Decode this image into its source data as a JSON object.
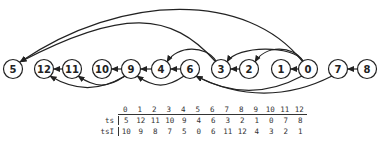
{
  "graph": {
    "nodes": [
      "5",
      "12",
      "11",
      "10",
      "9",
      "4",
      "6",
      "3",
      "2",
      "1",
      "0",
      "7",
      "8"
    ],
    "edges": [
      {
        "from": "11",
        "to": "12",
        "style": "straight"
      },
      {
        "from": "9",
        "to": "10",
        "style": "straight"
      },
      {
        "from": "4",
        "to": "9",
        "style": "straight"
      },
      {
        "from": "6",
        "to": "4",
        "style": "straight"
      },
      {
        "from": "2",
        "to": "3",
        "style": "straight"
      },
      {
        "from": "0",
        "to": "1",
        "style": "straight"
      },
      {
        "from": "8",
        "to": "7",
        "style": "straight"
      },
      {
        "from": "9",
        "to": "12",
        "style": "below"
      },
      {
        "from": "9",
        "to": "11",
        "style": "below"
      },
      {
        "from": "6",
        "to": "9",
        "style": "below"
      },
      {
        "from": "3",
        "to": "4",
        "style": "above"
      },
      {
        "from": "0",
        "to": "3",
        "style": "above"
      },
      {
        "from": "0",
        "to": "2",
        "style": "above"
      },
      {
        "from": "0",
        "to": "5",
        "style": "arc-high"
      },
      {
        "from": "3",
        "to": "5",
        "style": "arc-low"
      },
      {
        "from": "0",
        "to": "6",
        "style": "below"
      },
      {
        "from": "7",
        "to": "6",
        "style": "below"
      }
    ]
  },
  "table": {
    "header": [
      "0",
      "1",
      "2",
      "3",
      "4",
      "5",
      "6",
      "7",
      "8",
      "9",
      "10",
      "11",
      "12"
    ],
    "rows": [
      {
        "label": "ts",
        "values": [
          "5",
          "12",
          "11",
          "10",
          "9",
          "4",
          "6",
          "3",
          "2",
          "1",
          "0",
          "7",
          "8"
        ]
      },
      {
        "label": "tsI",
        "values": [
          "10",
          "9",
          "8",
          "7",
          "5",
          "0",
          "6",
          "11",
          "12",
          "4",
          "3",
          "2",
          "1"
        ]
      }
    ]
  }
}
